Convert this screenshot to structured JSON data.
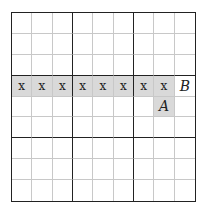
{
  "puzzle": {
    "type": "sudoku-grid",
    "size": 9,
    "box_size": 3,
    "colors": {
      "shaded": "#d9d9d9",
      "thin_line": "#c8c8c8",
      "thick_line": "#222222"
    },
    "cells": [
      {
        "row": 4,
        "col": 1,
        "text": "x",
        "shaded": true,
        "style": "mark"
      },
      {
        "row": 4,
        "col": 2,
        "text": "x",
        "shaded": true,
        "style": "mark"
      },
      {
        "row": 4,
        "col": 3,
        "text": "x",
        "shaded": true,
        "style": "mark"
      },
      {
        "row": 4,
        "col": 4,
        "text": "x",
        "shaded": true,
        "style": "mark"
      },
      {
        "row": 4,
        "col": 5,
        "text": "x",
        "shaded": true,
        "style": "mark"
      },
      {
        "row": 4,
        "col": 6,
        "text": "x",
        "shaded": true,
        "style": "mark"
      },
      {
        "row": 4,
        "col": 7,
        "text": "x",
        "shaded": true,
        "style": "mark"
      },
      {
        "row": 4,
        "col": 8,
        "text": "x",
        "shaded": true,
        "style": "mark"
      },
      {
        "row": 4,
        "col": 9,
        "text": "B",
        "shaded": false,
        "style": "label"
      },
      {
        "row": 5,
        "col": 8,
        "text": "A",
        "shaded": true,
        "style": "label"
      }
    ]
  }
}
